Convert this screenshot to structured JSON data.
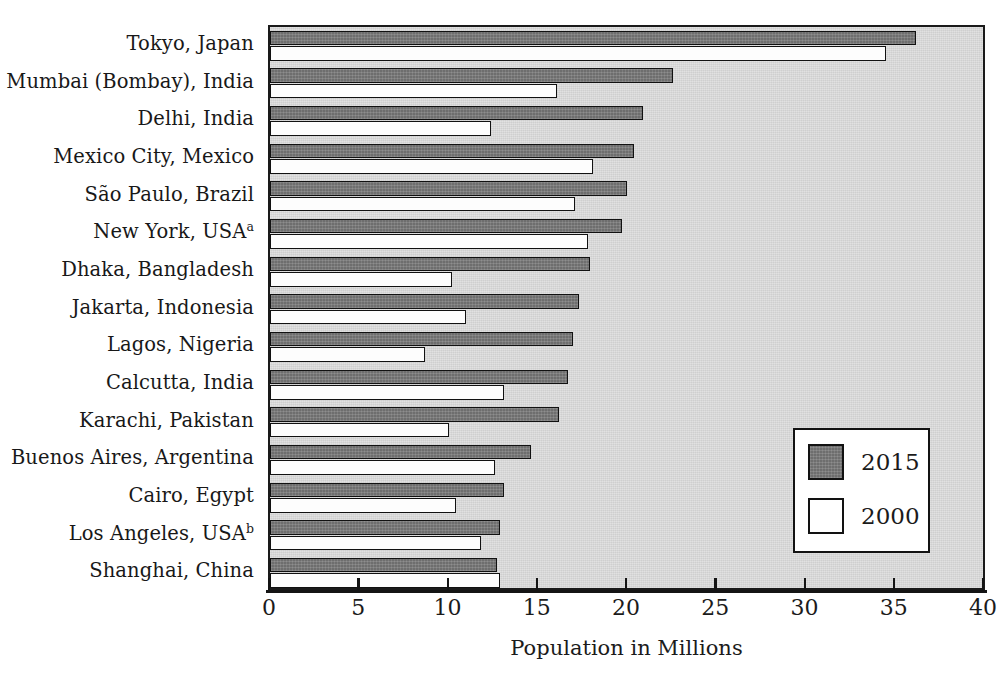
{
  "chart_data": {
    "type": "bar",
    "orientation": "horizontal",
    "title": "",
    "xlabel": "Population in Millions",
    "ylabel": "",
    "xlim": [
      0,
      40
    ],
    "xticks": [
      0,
      5,
      10,
      15,
      20,
      25,
      30,
      35,
      40
    ],
    "xtick_labels": [
      "0",
      "5",
      "10",
      "15",
      "20",
      "25",
      "30",
      "35",
      "40"
    ],
    "grid": false,
    "legend_position": "lower right",
    "categories": [
      "Tokyo, Japan",
      "Mumbai (Bombay), India",
      "Delhi, India",
      "Mexico City, Mexico",
      "São Paulo, Brazil",
      "New York, USA",
      "Dhaka, Bangladesh",
      "Jakarta, Indonesia",
      "Lagos, Nigeria",
      "Calcutta, India",
      "Karachi, Pakistan",
      "Buenos Aires, Argentina",
      "Cairo, Egypt",
      "Los Angeles, USA",
      "Shanghai, China"
    ],
    "category_footnotes": [
      "",
      "",
      "",
      "",
      "",
      "a",
      "",
      "",
      "",
      "",
      "",
      "",
      "",
      "b",
      ""
    ],
    "series": [
      {
        "name": "2015",
        "color": "#6e6e6e",
        "values": [
          36.2,
          22.6,
          20.9,
          20.4,
          20.0,
          19.7,
          17.9,
          17.3,
          17.0,
          16.7,
          16.2,
          14.6,
          13.1,
          12.9,
          12.7
        ]
      },
      {
        "name": "2000",
        "color": "#ffffff",
        "values": [
          34.5,
          16.1,
          12.4,
          18.1,
          17.1,
          17.8,
          10.2,
          11.0,
          8.7,
          13.1,
          10.0,
          12.6,
          10.4,
          11.8,
          12.9
        ]
      }
    ]
  },
  "legend": {
    "entries": [
      {
        "label": "2015"
      },
      {
        "label": "2000"
      }
    ]
  },
  "axis": {
    "x_title": "Population in Millions"
  }
}
